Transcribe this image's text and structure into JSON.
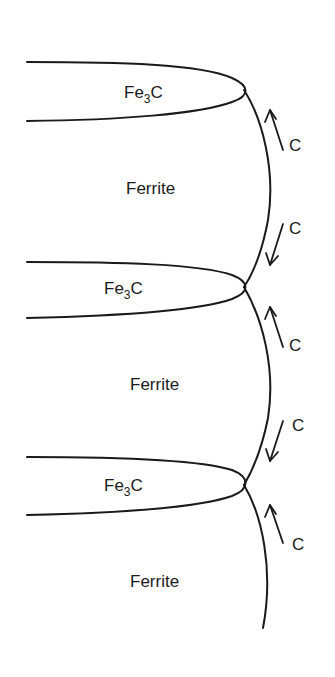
{
  "diagram": {
    "type": "pearlite-growth-schematic",
    "phases": [
      {
        "id": "fe3c-1",
        "label_main": "Fe",
        "label_sub": "3",
        "label_tail": "C"
      },
      {
        "id": "ferrite-1",
        "label": "Ferrite"
      },
      {
        "id": "fe3c-2",
        "label_main": "Fe",
        "label_sub": "3",
        "label_tail": "C"
      },
      {
        "id": "ferrite-2",
        "label": "Ferrite"
      },
      {
        "id": "fe3c-3",
        "label_main": "Fe",
        "label_sub": "3",
        "label_tail": "C"
      },
      {
        "id": "ferrite-3",
        "label": "Ferrite"
      }
    ],
    "diffusion_arrows": [
      {
        "label": "C",
        "direction": "up"
      },
      {
        "label": "C",
        "direction": "down"
      },
      {
        "label": "C",
        "direction": "up"
      },
      {
        "label": "C",
        "direction": "down"
      },
      {
        "label": "C",
        "direction": "up"
      }
    ],
    "colors": {
      "stroke": "#1a1a1a",
      "background": "#ffffff"
    }
  }
}
